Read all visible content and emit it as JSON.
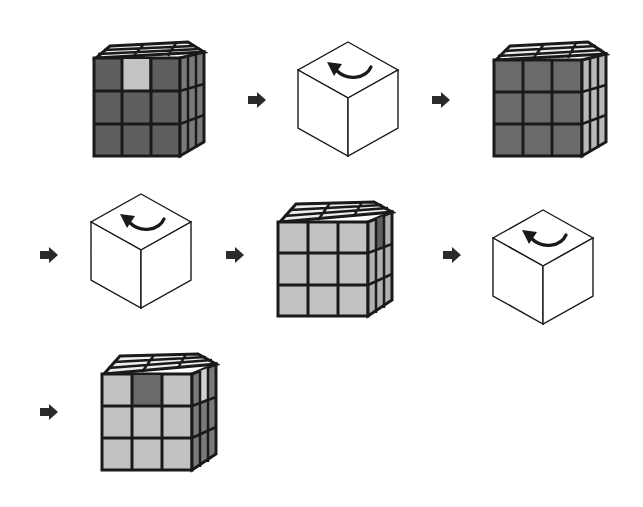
{
  "diagram": {
    "colors": {
      "dark": "#5f5f5f",
      "mid": "#9a9a9a",
      "light": "#c4c4c4",
      "top": "#ececec",
      "outline": "#1a1a1a",
      "arrow": "#2a2a2a"
    },
    "steps": [
      {
        "type": "cube",
        "label": "cube-state-1"
      },
      {
        "type": "rotation",
        "label": "rotate-whole-cube"
      },
      {
        "type": "cube",
        "label": "cube-state-2"
      },
      {
        "type": "rotation",
        "label": "rotate-whole-cube"
      },
      {
        "type": "cube",
        "label": "cube-state-3"
      },
      {
        "type": "rotation",
        "label": "rotate-whole-cube"
      },
      {
        "type": "cube",
        "label": "cube-state-4"
      }
    ]
  }
}
